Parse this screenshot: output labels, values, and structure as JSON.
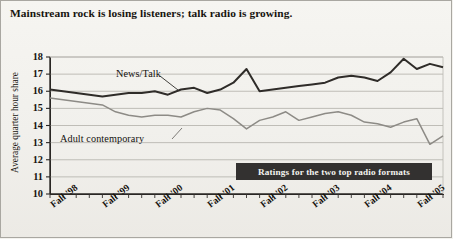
{
  "headline": "Mainstream rock is losing listeners; talk radio is growing.",
  "caption": "Ratings for the two top radio formats",
  "axis": {
    "ylabel": "Average quarter hour share",
    "yticks": [
      "18",
      "17",
      "16",
      "15",
      "14",
      "13",
      "12",
      "11",
      "10"
    ],
    "xticks": [
      "Fall '98",
      "Fall '99",
      "Fall '00",
      "Fall '01",
      "Fall '02",
      "Fall '03",
      "Fall '04",
      "Fall '05"
    ]
  },
  "series_labels": {
    "news_talk": "News/Talk",
    "adult_contemporary": "Adult contemporary"
  },
  "colors": {
    "news_talk": "#2f2c29",
    "adult_contemporary": "#8d8b86",
    "grid": "#b9b7b1",
    "axis": "#2a2724",
    "caption_bar": "#333130",
    "caption_text": "#f4f3ef",
    "background": "#f1f0ec"
  },
  "chart_data": {
    "type": "line",
    "title": "Mainstream rock is losing listeners; talk radio is growing.",
    "subtitle": "Ratings for the two top radio formats",
    "xlabel": "",
    "ylabel": "Average quarter hour share",
    "ylim": [
      10,
      18
    ],
    "ytick_values": [
      10,
      11,
      12,
      13,
      14,
      15,
      16,
      17,
      18
    ],
    "grid": true,
    "legend": "inline-labels",
    "x_tick_labels": [
      "Fall '98",
      "Fall '99",
      "Fall '00",
      "Fall '01",
      "Fall '02",
      "Fall '03",
      "Fall '04",
      "Fall '05"
    ],
    "x_tick_positions": [
      0,
      4,
      8,
      12,
      16,
      20,
      24,
      28
    ],
    "x_index": [
      0,
      1,
      2,
      3,
      4,
      5,
      6,
      7,
      8,
      9,
      10,
      11,
      12,
      13,
      14,
      15,
      16,
      17,
      18,
      19,
      20,
      21,
      22,
      23,
      24,
      25,
      26,
      27,
      28,
      29,
      30
    ],
    "series": [
      {
        "name": "News/Talk",
        "color": "#2f2c29",
        "values": [
          16.1,
          16.0,
          15.9,
          15.8,
          15.7,
          15.8,
          15.9,
          15.9,
          16.0,
          15.8,
          16.1,
          16.2,
          15.9,
          16.1,
          16.5,
          17.3,
          16.0,
          16.1,
          16.2,
          16.3,
          16.4,
          16.5,
          16.8,
          16.9,
          16.8,
          16.6,
          17.1,
          17.9,
          17.3,
          17.6,
          17.4
        ]
      },
      {
        "name": "Adult contemporary",
        "color": "#8d8b86",
        "values": [
          15.6,
          15.5,
          15.4,
          15.3,
          15.2,
          14.8,
          14.6,
          14.5,
          14.6,
          14.6,
          14.5,
          14.8,
          15.0,
          14.9,
          14.4,
          13.8,
          14.3,
          14.5,
          14.8,
          14.3,
          14.5,
          14.7,
          14.8,
          14.6,
          14.2,
          14.1,
          13.9,
          14.2,
          14.4,
          12.9,
          13.4
        ]
      }
    ]
  }
}
